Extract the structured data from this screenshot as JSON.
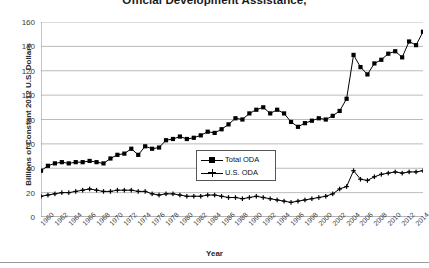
{
  "chart_data": {
    "type": "line",
    "title": "Official Development Assistance,",
    "xlabel": "Year",
    "ylabel": "Billions of Constant 2012 U.S. Dollars",
    "ylim": [
      0,
      160
    ],
    "ytick_step": 20,
    "yticks": [
      "0",
      "20",
      "40",
      "60",
      "80",
      "100",
      "120",
      "140",
      "160"
    ],
    "xlim": [
      1960,
      2015
    ],
    "xtick_step": 2,
    "grid": "horizontal",
    "legend_position": "center",
    "x": [
      1960,
      1961,
      1962,
      1963,
      1964,
      1965,
      1966,
      1967,
      1968,
      1969,
      1970,
      1971,
      1972,
      1973,
      1974,
      1975,
      1976,
      1977,
      1978,
      1979,
      1980,
      1981,
      1982,
      1983,
      1984,
      1985,
      1986,
      1987,
      1988,
      1989,
      1990,
      1991,
      1992,
      1993,
      1994,
      1995,
      1996,
      1997,
      1998,
      1999,
      2000,
      2001,
      2002,
      2003,
      2004,
      2005,
      2006,
      2007,
      2008,
      2009,
      2010,
      2011,
      2012,
      2013,
      2014,
      2015
    ],
    "xtick_labels": [
      "1960",
      "1962",
      "1964",
      "1966",
      "1968",
      "1970",
      "1972",
      "1974",
      "1976",
      "1978",
      "1980",
      "1982",
      "1984",
      "1986",
      "1988",
      "1990",
      "1992",
      "1994",
      "1996",
      "1998",
      "2000",
      "2002",
      "2004",
      "2006",
      "2008",
      "2010",
      "2012",
      "2014"
    ],
    "series": [
      {
        "name": "Total ODA",
        "marker": "square",
        "color": "#000000",
        "values": [
          38,
          42,
          44,
          45,
          44,
          45,
          45,
          46,
          45,
          44,
          48,
          51,
          52,
          56,
          51,
          58,
          56,
          57,
          63,
          64,
          66,
          64,
          65,
          67,
          70,
          69,
          72,
          76,
          81,
          80,
          85,
          88,
          90,
          85,
          88,
          85,
          78,
          74,
          77,
          79,
          81,
          80,
          83,
          87,
          97,
          133,
          123,
          117,
          126,
          129,
          134,
          136,
          131,
          144,
          141,
          152
        ]
      },
      {
        "name": "U.S. ODA",
        "marker": "plus",
        "color": "#000000",
        "values": [
          17,
          18,
          19,
          20,
          20,
          21,
          22,
          23,
          22,
          21,
          21,
          22,
          22,
          22,
          21,
          21,
          19,
          18,
          19,
          19,
          18,
          17,
          17,
          17,
          18,
          18,
          17,
          16,
          16,
          15,
          16,
          17,
          16,
          15,
          14,
          13,
          12,
          13,
          14,
          15,
          16,
          17,
          19,
          23,
          25,
          38,
          31,
          30,
          33,
          35,
          36,
          37,
          36,
          37,
          37,
          38
        ]
      }
    ]
  }
}
